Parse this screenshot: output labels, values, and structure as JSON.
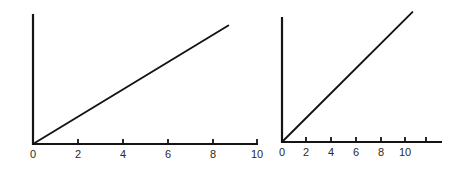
{
  "figure": {
    "background_color": "#ffffff",
    "line_color": "#131313",
    "axis_color": "#141414",
    "label_color": "#2a2a2a",
    "panel_count": 2
  },
  "chart_data": [
    {
      "type": "line",
      "title": "",
      "subtitle": "",
      "xlabel": "",
      "ylabel": "",
      "legend": [],
      "annotations": [],
      "grid": false,
      "legend_position": "none",
      "xlim": [
        0,
        10.8
      ],
      "ylim": [
        0,
        11.5
      ],
      "x_ticks": [
        0,
        2,
        4,
        6,
        8,
        10
      ],
      "x_tick_labels": [
        "0",
        "2",
        "4",
        "6",
        "8",
        "10"
      ],
      "y_ticks": [],
      "y_tick_labels": [],
      "series": [
        {
          "name": "line-1",
          "x": [
            0,
            8.7
          ],
          "values": [
            0,
            7.6
          ],
          "slope": 0.874,
          "intercept": 0
        }
      ]
    },
    {
      "type": "line",
      "title": "",
      "subtitle": "",
      "xlabel": "",
      "ylabel": "",
      "legend": [],
      "annotations": [],
      "grid": false,
      "legend_position": "none",
      "xlim": [
        0,
        13.5
      ],
      "ylim": [
        0,
        11.5
      ],
      "x_ticks": [
        0,
        2,
        4,
        6,
        8,
        10,
        12
      ],
      "x_tick_labels": [
        "0",
        "2",
        "4",
        "6",
        "8",
        "10",
        ""
      ],
      "y_ticks": [],
      "y_tick_labels": [],
      "series": [
        {
          "name": "line-1",
          "x": [
            0,
            10.6
          ],
          "values": [
            0,
            11.1
          ],
          "slope": 1.047,
          "intercept": 0
        }
      ]
    }
  ]
}
